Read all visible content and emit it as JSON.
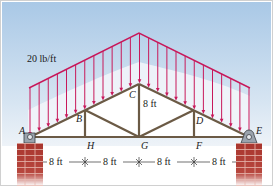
{
  "diagram": {
    "load_label": "20 lb/ft",
    "height_label": "8 ft",
    "joints": {
      "A": "A",
      "B": "B",
      "C": "C",
      "D": "D",
      "E": "E",
      "F": "F",
      "G": "G",
      "H": "H"
    },
    "dimensions": [
      "8 ft",
      "8 ft",
      "8 ft",
      "8 ft"
    ],
    "colors": {
      "sky_top": "#a9c8e6",
      "sky_bottom": "#e6eef6",
      "load": "#c8185a",
      "member": "#6b5a45",
      "brick": "#a8352e"
    }
  }
}
